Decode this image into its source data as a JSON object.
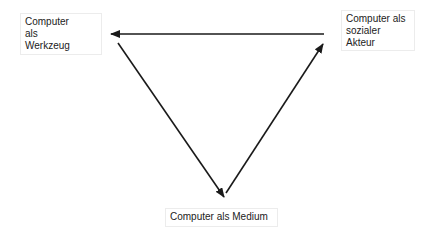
{
  "diagram": {
    "type": "triangle-cycle",
    "nodes": [
      {
        "id": "tool",
        "label": "Computer\nals\nWerkzeug"
      },
      {
        "id": "actor",
        "label": "Computer als\nsozialer\nAkteur"
      },
      {
        "id": "medium",
        "label": "Computer als Medium"
      }
    ],
    "edges": [
      {
        "from": "actor",
        "to": "tool"
      },
      {
        "from": "tool",
        "to": "medium"
      },
      {
        "from": "medium",
        "to": "actor"
      }
    ],
    "colors": {
      "arrow": "#1a1a1a",
      "box_border": "#ececec",
      "text": "#222222"
    }
  }
}
